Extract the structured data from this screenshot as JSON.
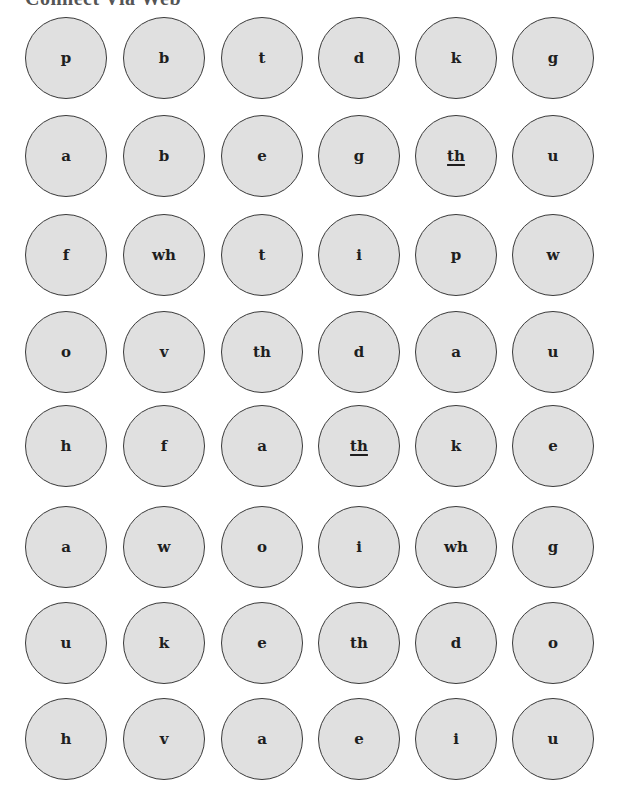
{
  "title": "Connect Via Web",
  "colors": {
    "circle_fill": "#e0e0e0",
    "circle_stroke": "#3a3a3a",
    "text": "#1e1e1e"
  },
  "rows": [
    [
      {
        "text": "p",
        "underlined": false
      },
      {
        "text": "b",
        "underlined": false
      },
      {
        "text": "t",
        "underlined": false
      },
      {
        "text": "d",
        "underlined": false
      },
      {
        "text": "k",
        "underlined": false
      },
      {
        "text": "g",
        "underlined": false
      }
    ],
    [
      {
        "text": "a",
        "underlined": false
      },
      {
        "text": "b",
        "underlined": false
      },
      {
        "text": "e",
        "underlined": false
      },
      {
        "text": "g",
        "underlined": false
      },
      {
        "text": "th",
        "underlined": true
      },
      {
        "text": "u",
        "underlined": false
      }
    ],
    [
      {
        "text": "f",
        "underlined": false
      },
      {
        "text": "wh",
        "underlined": false
      },
      {
        "text": "t",
        "underlined": false
      },
      {
        "text": "i",
        "underlined": false
      },
      {
        "text": "p",
        "underlined": false
      },
      {
        "text": "w",
        "underlined": false
      }
    ],
    [
      {
        "text": "o",
        "underlined": false
      },
      {
        "text": "v",
        "underlined": false
      },
      {
        "text": "th",
        "underlined": false
      },
      {
        "text": "d",
        "underlined": false
      },
      {
        "text": "a",
        "underlined": false
      },
      {
        "text": "u",
        "underlined": false
      }
    ],
    [
      {
        "text": "h",
        "underlined": false
      },
      {
        "text": "f",
        "underlined": false
      },
      {
        "text": "a",
        "underlined": false
      },
      {
        "text": "th",
        "underlined": true
      },
      {
        "text": "k",
        "underlined": false
      },
      {
        "text": "e",
        "underlined": false
      }
    ],
    [
      {
        "text": "a",
        "underlined": false
      },
      {
        "text": "w",
        "underlined": false
      },
      {
        "text": "o",
        "underlined": false
      },
      {
        "text": "i",
        "underlined": false
      },
      {
        "text": "wh",
        "underlined": false
      },
      {
        "text": "g",
        "underlined": false
      }
    ],
    [
      {
        "text": "u",
        "underlined": false
      },
      {
        "text": "k",
        "underlined": false
      },
      {
        "text": "e",
        "underlined": false
      },
      {
        "text": "th",
        "underlined": false
      },
      {
        "text": "d",
        "underlined": false
      },
      {
        "text": "o",
        "underlined": false
      }
    ],
    [
      {
        "text": "h",
        "underlined": false
      },
      {
        "text": "v",
        "underlined": false
      },
      {
        "text": "a",
        "underlined": false
      },
      {
        "text": "e",
        "underlined": false
      },
      {
        "text": "i",
        "underlined": false
      },
      {
        "text": "u",
        "underlined": false
      }
    ]
  ]
}
